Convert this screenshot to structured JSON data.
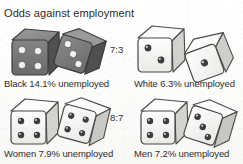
{
  "figure": {
    "title": "Odds against employment",
    "background_color": "#fdfdfc",
    "text_color": "#2b2b2b"
  },
  "ratios": [
    {
      "id": "black-vs-white",
      "label": "7:3"
    },
    {
      "id": "women-vs-men",
      "label": "8:7"
    }
  ],
  "panels": [
    {
      "id": "black",
      "caption": "Black 14.1% unemployed",
      "group": "Black",
      "rate": "14.1%",
      "status": "unemployed",
      "die_color": "dark",
      "die_face_color": "#6e6e6e",
      "pip_color": "#f2f2f2",
      "dice": [
        {
          "pips": 4,
          "orientation": "upright"
        },
        {
          "pips": 3,
          "orientation": "tilted"
        }
      ]
    },
    {
      "id": "white",
      "caption": "White 6.3% unemployed",
      "group": "White",
      "rate": "6.3%",
      "status": "unemployed",
      "die_color": "light",
      "die_face_color": "#f7f7f5",
      "pip_color": "#3a3a3a",
      "dice": [
        {
          "pips": 2,
          "orientation": "upright"
        },
        {
          "pips": 1,
          "orientation": "tilted"
        }
      ]
    },
    {
      "id": "women",
      "caption": "Women 7.9% unemployed",
      "group": "Women",
      "rate": "7.9%",
      "status": "unemployed",
      "die_color": "light",
      "die_face_color": "#f7f7f5",
      "pip_color": "#3a3a3a",
      "dice": [
        {
          "pips": 4,
          "orientation": "upright"
        },
        {
          "pips": 4,
          "orientation": "tilted"
        }
      ]
    },
    {
      "id": "men",
      "caption": "Men 7.2% unemployed",
      "group": "Men",
      "rate": "7.2%",
      "status": "unemployed",
      "die_color": "light",
      "die_face_color": "#f7f7f5",
      "pip_color": "#3a3a3a",
      "dice": [
        {
          "pips": 4,
          "orientation": "upright"
        },
        {
          "pips": 3,
          "orientation": "tilted"
        }
      ]
    }
  ]
}
